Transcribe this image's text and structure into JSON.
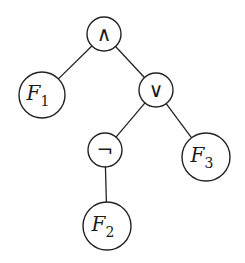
{
  "diagram": {
    "type": "expression-tree",
    "nodes": [
      {
        "id": "and",
        "label": "∧",
        "kind": "operator",
        "cx": 104,
        "cy": 34,
        "r": 17
      },
      {
        "id": "f1",
        "label": "F",
        "sub": "1",
        "kind": "leaf",
        "cx": 42,
        "cy": 95,
        "r": 23
      },
      {
        "id": "or",
        "label": "∨",
        "kind": "operator",
        "cx": 156,
        "cy": 90,
        "r": 17
      },
      {
        "id": "not",
        "label": "¬",
        "kind": "operator",
        "cx": 105,
        "cy": 150,
        "r": 17
      },
      {
        "id": "f3",
        "label": "F",
        "sub": "3",
        "kind": "leaf",
        "cx": 206,
        "cy": 157,
        "r": 24
      },
      {
        "id": "f2",
        "label": "F",
        "sub": "2",
        "kind": "leaf",
        "cx": 107,
        "cy": 226,
        "r": 24
      }
    ],
    "edges": [
      {
        "from": "and",
        "to": "f1"
      },
      {
        "from": "and",
        "to": "or"
      },
      {
        "from": "or",
        "to": "not"
      },
      {
        "from": "or",
        "to": "f3"
      },
      {
        "from": "not",
        "to": "f2"
      }
    ]
  }
}
